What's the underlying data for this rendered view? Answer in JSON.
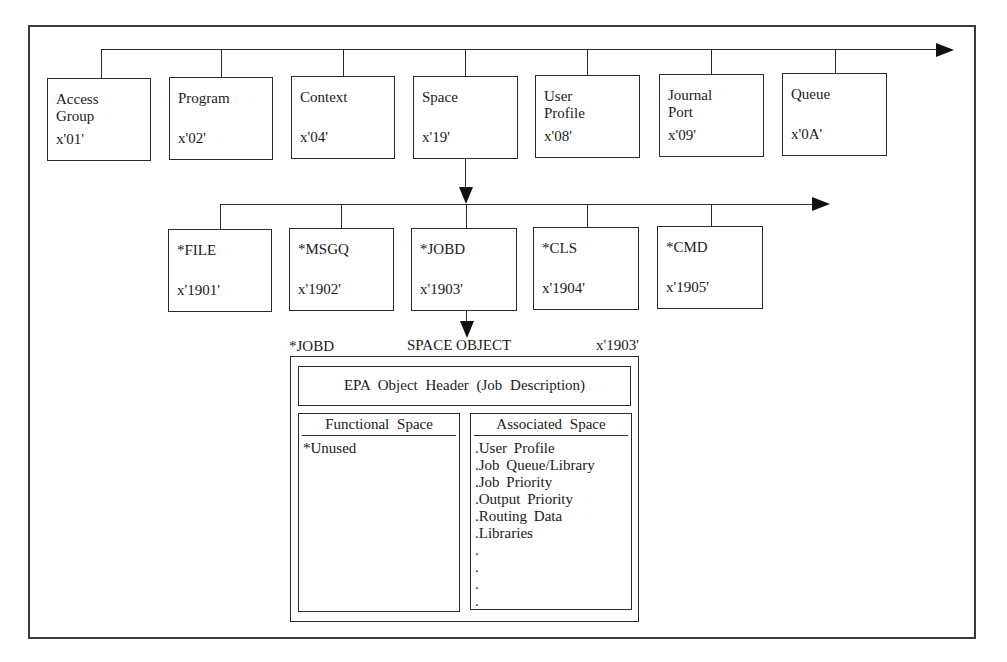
{
  "diagram": {
    "top_row": [
      {
        "name": "Access\nGroup",
        "code": "x'01'"
      },
      {
        "name": "Program",
        "code": "x'02'"
      },
      {
        "name": "Context",
        "code": "x'04'"
      },
      {
        "name": "Space",
        "code": "x'19'"
      },
      {
        "name": "User\nProfile",
        "code": "x'08'"
      },
      {
        "name": "Journal\nPort",
        "code": "x'09'"
      },
      {
        "name": "Queue",
        "code": "x'0A'"
      }
    ],
    "space_subtypes": [
      {
        "name": "*FILE",
        "code": "x'1901'"
      },
      {
        "name": "*MSGQ",
        "code": "x'1902'"
      },
      {
        "name": "*JOBD",
        "code": "x'1903'"
      },
      {
        "name": "*CLS",
        "code": "x'1904'"
      },
      {
        "name": "*CMD",
        "code": "x'1905'"
      }
    ],
    "space_object": {
      "left_label": "*JOBD",
      "title": "SPACE OBJECT",
      "right_label": "x'1903'",
      "header": "EPA Object Header (Job Description)",
      "functional_space": {
        "title": "Functional Space",
        "items": [
          "*Unused"
        ]
      },
      "associated_space": {
        "title": "Associated Space",
        "items": [
          ".User Profile",
          ".Job Queue/Library",
          ".Job Priority",
          ".Output Priority",
          ".Routing Data",
          ".Libraries",
          ".",
          ".",
          ".",
          "."
        ]
      }
    }
  }
}
